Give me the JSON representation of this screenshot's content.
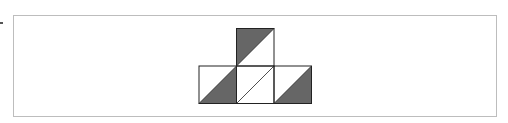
{
  "diagram": {
    "colors": {
      "fill": "#666666",
      "stroke": "#222222",
      "frame": "#bdbdbd",
      "background": "#ffffff"
    },
    "cell_size": 37.5,
    "cells": [
      {
        "id": "top",
        "x": 236.5,
        "y": 28.5,
        "shaded_half": "upper-left"
      },
      {
        "id": "bottom-left",
        "x": 199,
        "y": 66,
        "shaded_half": "lower-right"
      },
      {
        "id": "bottom-middle",
        "x": 236.5,
        "y": 66,
        "shaded_half": "none"
      },
      {
        "id": "bottom-right",
        "x": 274,
        "y": 66,
        "shaded_half": "lower-right"
      }
    ]
  }
}
